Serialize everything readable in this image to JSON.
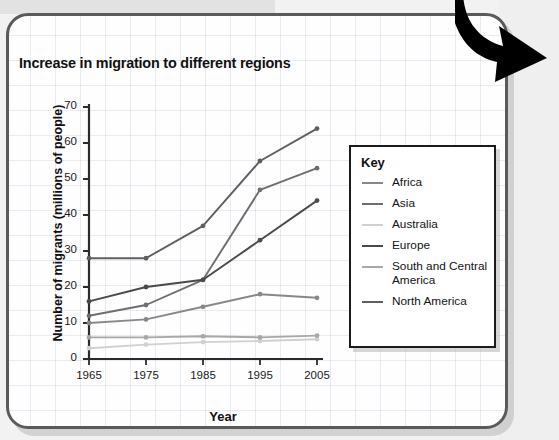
{
  "card": {
    "arrow_icon": "curved-down-right-arrow-icon"
  },
  "chart_data": {
    "type": "line",
    "title": "Increase in migration to different regions",
    "xlabel": "Year",
    "ylabel": "Number of migrants (millions of people)",
    "categories": [
      "1965",
      "1975",
      "1985",
      "1995",
      "2005"
    ],
    "x": [
      1965,
      1975,
      1985,
      1995,
      2005
    ],
    "xlim": [
      1965,
      2005
    ],
    "ylim": [
      0,
      70
    ],
    "yticks": [
      0,
      10,
      20,
      30,
      40,
      50,
      60,
      70
    ],
    "grid": false,
    "legend_position": "right",
    "legend_title": "Key",
    "series": [
      {
        "name": "Africa",
        "color": "#888888",
        "values": [
          10,
          11,
          14.5,
          18,
          17
        ]
      },
      {
        "name": "Asia",
        "color": "#6e6e6e",
        "values": [
          12,
          15,
          22,
          47,
          53
        ]
      },
      {
        "name": "Australia",
        "color": "#d0d0d0",
        "values": [
          3,
          4,
          4.7,
          5,
          5.5
        ]
      },
      {
        "name": "Europe",
        "color": "#4a4a4a",
        "values": [
          16,
          20,
          22,
          33,
          44
        ]
      },
      {
        "name": "South and Central America",
        "color": "#a8a8a8",
        "values": [
          6,
          6,
          6.3,
          6,
          6.5
        ]
      },
      {
        "name": "North America",
        "color": "#5f5f5f",
        "values": [
          28,
          28,
          37,
          55,
          64
        ]
      }
    ]
  }
}
